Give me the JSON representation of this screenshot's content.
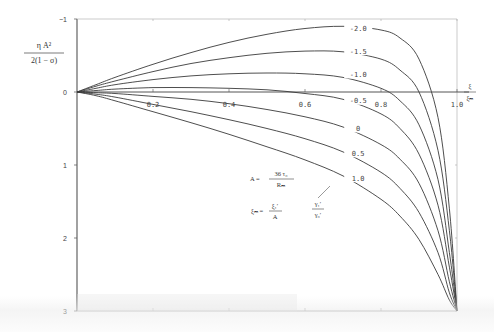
{
  "chart_data": {
    "type": "line",
    "title": "",
    "ylabel": {
      "numerator": "η A²",
      "denominator": "2(1 − σ)"
    },
    "xlabel": {
      "numerator": "ξ",
      "denominator": "ξₘ"
    },
    "x_ticks": [
      "0.2",
      "0.4",
      "0.6",
      "0.8",
      "1.0"
    ],
    "y_ticks": [
      "−1",
      "0",
      "1",
      "2",
      "3"
    ],
    "xlim": [
      0,
      1.0
    ],
    "ylim": [
      3,
      -1
    ],
    "y_inverted": true,
    "grid": false,
    "parameter_label": "γ₁′ / γ₀′",
    "annotations": [
      {
        "text": "A = 36 τ₀ / Rₘ"
      },
      {
        "text": "ξₘ = ξ₁′ / A"
      }
    ],
    "x": [
      0,
      0.05,
      0.1,
      0.2,
      0.3,
      0.4,
      0.5,
      0.6,
      0.7,
      0.8,
      0.85,
      0.9,
      0.95,
      0.98,
      1.0
    ],
    "series": [
      {
        "name": "-2.0",
        "values": [
          0,
          -0.1,
          -0.2,
          -0.38,
          -0.54,
          -0.68,
          -0.79,
          -0.87,
          -0.9,
          -0.85,
          -0.74,
          -0.45,
          0.35,
          1.6,
          3.0
        ]
      },
      {
        "name": "-1.5",
        "values": [
          0,
          -0.08,
          -0.15,
          -0.28,
          -0.39,
          -0.47,
          -0.53,
          -0.56,
          -0.55,
          -0.45,
          -0.3,
          0.0,
          0.8,
          1.9,
          3.0
        ]
      },
      {
        "name": "-1.0",
        "values": [
          0,
          -0.05,
          -0.1,
          -0.17,
          -0.22,
          -0.25,
          -0.26,
          -0.25,
          -0.2,
          -0.05,
          0.12,
          0.45,
          1.2,
          2.2,
          3.0
        ]
      },
      {
        "name": "-0.5",
        "values": [
          0,
          -0.02,
          -0.04,
          -0.06,
          -0.06,
          -0.05,
          -0.03,
          0.02,
          0.1,
          0.3,
          0.5,
          0.85,
          1.55,
          2.4,
          3.0
        ]
      },
      {
        "name": "0",
        "values": [
          0,
          0.01,
          0.02,
          0.06,
          0.1,
          0.16,
          0.24,
          0.34,
          0.48,
          0.72,
          0.92,
          1.25,
          1.9,
          2.6,
          3.0
        ]
      },
      {
        "name": "0.5",
        "values": [
          0,
          0.03,
          0.07,
          0.17,
          0.27,
          0.38,
          0.5,
          0.64,
          0.82,
          1.1,
          1.32,
          1.65,
          2.2,
          2.75,
          3.0
        ]
      },
      {
        "name": "1.0",
        "values": [
          0,
          0.05,
          0.12,
          0.27,
          0.42,
          0.58,
          0.75,
          0.93,
          1.15,
          1.47,
          1.7,
          2.02,
          2.5,
          2.85,
          3.0
        ]
      }
    ],
    "series_label_positions": [
      {
        "name": "-2.0",
        "x": 0.74,
        "y": -0.87
      },
      {
        "name": "-1.5",
        "x": 0.74,
        "y": -0.56
      },
      {
        "name": "-1.0",
        "x": 0.74,
        "y": -0.24
      },
      {
        "name": "-0.5",
        "x": 0.74,
        "y": 0.12
      },
      {
        "name": "0",
        "x": 0.74,
        "y": 0.5
      },
      {
        "name": "0.5",
        "x": 0.74,
        "y": 0.84
      },
      {
        "name": "1.0",
        "x": 0.74,
        "y": 1.18
      }
    ]
  },
  "labels": {
    "y_num": "η A²",
    "y_den": "2(1 − σ)",
    "x_num": "ξ",
    "x_den": "ξₘ",
    "formula_a_lhs": "A =",
    "formula_a_num": "36 τ₀",
    "formula_a_den": "Rₘ",
    "formula_b_lhs": "ξₘ =",
    "formula_b_num": "ξ₁′",
    "formula_b_den": "A",
    "param_num": "γ₁′",
    "param_den": "γ₀′"
  },
  "colors": {
    "axis": "#555555",
    "curve": "#3a3a3a",
    "text": "#444444"
  }
}
